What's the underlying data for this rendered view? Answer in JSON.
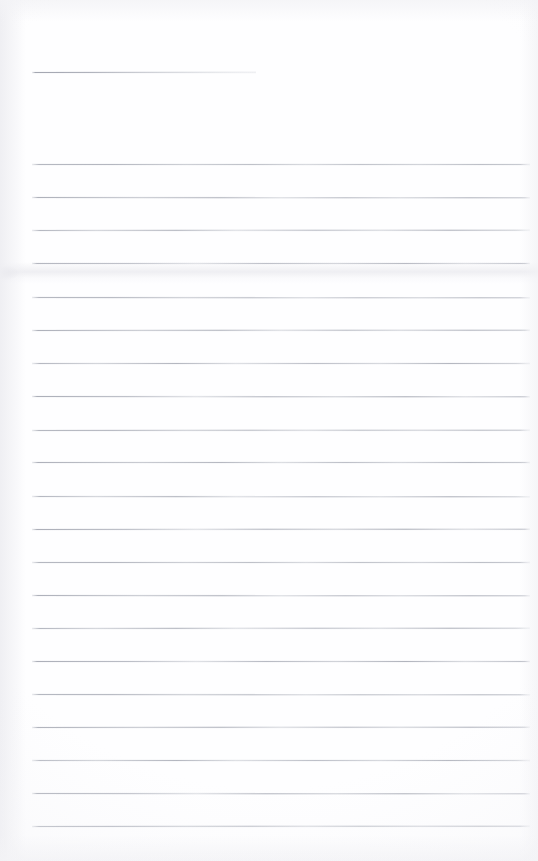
{
  "document": {
    "kind": "scanned-lined-notepad-page",
    "title": "Blank ruled notepad page",
    "description": "A scanned blank sheet of ruled notepad paper. No handwriting, no printed text, no headings — only faint grey horizontal ruling lines on off-white paper.",
    "page_width": 538,
    "page_height": 861,
    "paper_color": "#fefeff",
    "rule_color": "#b0b3bc",
    "text_content": "",
    "visible_text": []
  },
  "ruling": {
    "left_margin": 32,
    "right_margin": 530,
    "spacing": 33,
    "line_count": 22,
    "lines": [
      {
        "y": 72,
        "x_start": 32,
        "x_end": 256,
        "variant": "short",
        "note": "short header rule, fades out mid-page"
      },
      {
        "y": 164,
        "x_start": 32,
        "x_end": 530,
        "variant": "v1",
        "note": "full-width rule"
      },
      {
        "y": 197,
        "x_start": 32,
        "x_end": 530,
        "variant": "v2",
        "note": "full-width rule"
      },
      {
        "y": 230,
        "x_start": 32,
        "x_end": 530,
        "variant": "v3",
        "note": "full-width rule"
      },
      {
        "y": 263,
        "x_start": 32,
        "x_end": 530,
        "variant": "v4",
        "note": "full-width rule above crease"
      },
      {
        "y": 297,
        "x_start": 32,
        "x_end": 530,
        "variant": "v1",
        "note": "full-width rule"
      },
      {
        "y": 330,
        "x_start": 32,
        "x_end": 530,
        "variant": "v2",
        "note": "full-width rule"
      },
      {
        "y": 363,
        "x_start": 32,
        "x_end": 530,
        "variant": "v3",
        "note": "full-width rule"
      },
      {
        "y": 396,
        "x_start": 32,
        "x_end": 530,
        "variant": "v4",
        "note": "full-width rule"
      },
      {
        "y": 430,
        "x_start": 32,
        "x_end": 530,
        "variant": "v1",
        "note": "full-width rule"
      },
      {
        "y": 462,
        "x_start": 32,
        "x_end": 530,
        "variant": "v2",
        "note": "full-width rule"
      },
      {
        "y": 496,
        "x_start": 32,
        "x_end": 530,
        "variant": "v3",
        "note": "full-width rule"
      },
      {
        "y": 529,
        "x_start": 32,
        "x_end": 530,
        "variant": "v4",
        "note": "full-width rule"
      },
      {
        "y": 562,
        "x_start": 32,
        "x_end": 530,
        "variant": "v1",
        "note": "full-width rule"
      },
      {
        "y": 595,
        "x_start": 32,
        "x_end": 530,
        "variant": "v2",
        "note": "full-width rule"
      },
      {
        "y": 628,
        "x_start": 32,
        "x_end": 530,
        "variant": "v3",
        "note": "full-width rule"
      },
      {
        "y": 661,
        "x_start": 32,
        "x_end": 530,
        "variant": "v4",
        "note": "full-width rule"
      },
      {
        "y": 694,
        "x_start": 32,
        "x_end": 530,
        "variant": "v1",
        "note": "full-width rule"
      },
      {
        "y": 727,
        "x_start": 32,
        "x_end": 530,
        "variant": "v2",
        "note": "full-width rule"
      },
      {
        "y": 760,
        "x_start": 32,
        "x_end": 530,
        "variant": "v3",
        "note": "full-width rule"
      },
      {
        "y": 793,
        "x_start": 32,
        "x_end": 530,
        "variant": "v4",
        "note": "full-width rule"
      },
      {
        "y": 826,
        "x_start": 32,
        "x_end": 530,
        "variant": "v1",
        "note": "last full-width rule"
      }
    ]
  },
  "artifacts": {
    "crease_band": {
      "y": 262,
      "height": 22,
      "note": "faint horizontal crease / fold shadow across the sheet"
    },
    "crease_smudge": {
      "y": 266,
      "x": 0,
      "width": 34,
      "height": 14,
      "note": "darker smudge at the left edge of the crease"
    },
    "edge_shading": {
      "left": 26,
      "right": 18,
      "top": 22,
      "bottom": 26,
      "note": "soft grey shading along the scanned sheet edges"
    }
  }
}
